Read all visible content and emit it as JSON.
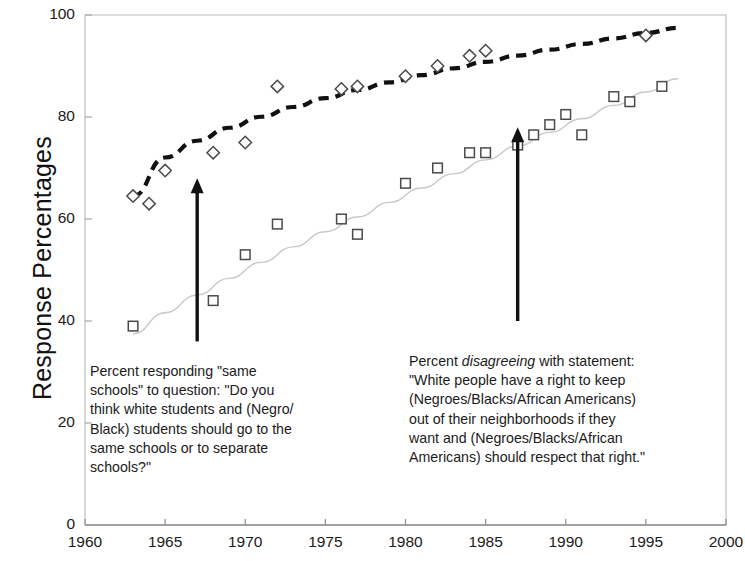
{
  "chart_data": {
    "type": "scatter",
    "title": "",
    "xlabel": "",
    "ylabel": "Response Percentages",
    "xlim": [
      1960,
      2000
    ],
    "ylim": [
      0,
      100
    ],
    "xticks": [
      1960,
      1965,
      1970,
      1975,
      1980,
      1985,
      1990,
      1995,
      2000
    ],
    "yticks": [
      0,
      20,
      40,
      60,
      80,
      100
    ],
    "grid": false,
    "legend": "none",
    "series": [
      {
        "name": "Percent responding \"same schools\"",
        "marker": "diamond",
        "trend": "dashed-bold-black",
        "points": [
          {
            "x": 1963,
            "y": 64.5
          },
          {
            "x": 1964,
            "y": 63.0
          },
          {
            "x": 1965,
            "y": 69.5
          },
          {
            "x": 1968,
            "y": 73.0
          },
          {
            "x": 1970,
            "y": 75.0
          },
          {
            "x": 1972,
            "y": 86.0
          },
          {
            "x": 1976,
            "y": 85.5
          },
          {
            "x": 1977,
            "y": 86.0
          },
          {
            "x": 1980,
            "y": 88.0
          },
          {
            "x": 1982,
            "y": 90.0
          },
          {
            "x": 1984,
            "y": 92.0
          },
          {
            "x": 1985,
            "y": 93.0
          },
          {
            "x": 1995,
            "y": 96.0
          }
        ]
      },
      {
        "name": "Percent disagreeing with segregated-neighborhood statement",
        "marker": "square",
        "trend": "thin-gray",
        "points": [
          {
            "x": 1963,
            "y": 39.0
          },
          {
            "x": 1968,
            "y": 44.0
          },
          {
            "x": 1970,
            "y": 53.0
          },
          {
            "x": 1972,
            "y": 59.0
          },
          {
            "x": 1976,
            "y": 60.0
          },
          {
            "x": 1977,
            "y": 57.0
          },
          {
            "x": 1980,
            "y": 67.0
          },
          {
            "x": 1982,
            "y": 70.0
          },
          {
            "x": 1984,
            "y": 73.0
          },
          {
            "x": 1985,
            "y": 73.0
          },
          {
            "x": 1987,
            "y": 74.5
          },
          {
            "x": 1988,
            "y": 76.5
          },
          {
            "x": 1989,
            "y": 78.5
          },
          {
            "x": 1990,
            "y": 80.5
          },
          {
            "x": 1991,
            "y": 76.5
          },
          {
            "x": 1993,
            "y": 84.0
          },
          {
            "x": 1994,
            "y": 83.0
          },
          {
            "x": 1996,
            "y": 86.0
          }
        ]
      }
    ],
    "annotations": [
      {
        "id": "left",
        "arrow_x": 1967,
        "arrow_y_from": 36,
        "arrow_y_to": 68,
        "text": "Percent responding \"same schools\" to question: \"Do you think white students and (Negro/Black) students should go to the same schools or to separate schools?\""
      },
      {
        "id": "right",
        "arrow_x": 1987,
        "arrow_y_from": 40,
        "arrow_y_to": 78,
        "text_lead": "Percent ",
        "text_italic": "disagreeing",
        "text_rest": " with statement: \"White people have a right to keep (Negroes/Blacks/African Americans) out of their neighborhoods if they want and (Negroes/Blacks/African Americans) should respect that right.\""
      }
    ],
    "colors": {
      "axis": "#b9b9b9",
      "diamond_trend": "#111111",
      "square_trend": "#c8c8c8",
      "marker_stroke": "#4a4a4a",
      "arrow": "#111111",
      "text": "#1b1b1b"
    }
  },
  "annotation_left_lines": [
    "Percent responding \"same",
    "schools\" to question: \"Do you",
    "think white students and (Negro/",
    "Black) students should go to the",
    "same schools or to separate",
    "schools?\""
  ],
  "annotation_right_lines_head": "Percent ",
  "annotation_right_italic": "disagreeing",
  "annotation_right_lines_tail": [
    " with statement:",
    "\"White people have a right to keep",
    "(Negroes/Blacks/African Americans)",
    "out of their neighborhoods if they",
    "want and (Negroes/Blacks/African",
    "Americans) should respect that right.\""
  ],
  "axis": {
    "ylabel": "Response Percentages",
    "ytick_labels": [
      "100",
      "80",
      "60",
      "40",
      "20",
      "0"
    ],
    "xtick_labels": [
      "1960",
      "1965",
      "1970",
      "1975",
      "1980",
      "1985",
      "1990",
      "1995",
      "2000"
    ]
  }
}
